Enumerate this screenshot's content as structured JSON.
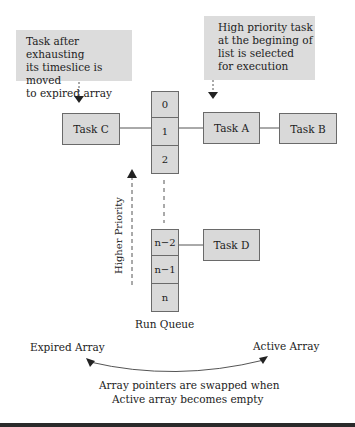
{
  "notes": {
    "expired_note": [
      "Task after exhausting",
      "its timeslice is moved",
      "to expired array"
    ],
    "active_note": [
      "High priority task",
      "at the begining of",
      "list is selected",
      "for execution"
    ]
  },
  "run_queue": {
    "label": "Run Queue",
    "cells": [
      "0",
      "1",
      "2",
      "n−2",
      "n−1",
      "n"
    ]
  },
  "tasks": {
    "task_c": "Task C",
    "task_a": "Task A",
    "task_b": "Task B",
    "task_d": "Task D"
  },
  "priority_label": "Higher Priority",
  "arrays": {
    "expired": "Expired Array",
    "active": "Active Array",
    "swap_note": [
      "Array pointers are swapped when",
      "Active array becomes empty"
    ]
  },
  "colors": {
    "box_fill": "#d9d9d9",
    "note_fill": "#dcdcdc",
    "border": "#6a6a6a",
    "text": "#222222"
  }
}
